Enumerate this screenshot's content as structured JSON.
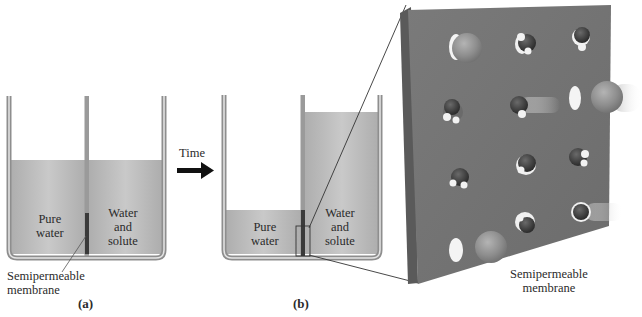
{
  "figure": {
    "panel_a": {
      "label": "(a)",
      "left_compartment": {
        "line1": "Pure",
        "line2": "water"
      },
      "right_compartment": {
        "line1": "Water",
        "line2": "and",
        "line3": "solute"
      },
      "callout": {
        "line1": "Semipermeable",
        "line2": "membrane"
      }
    },
    "transition": {
      "label": "Time"
    },
    "panel_b": {
      "label": "(b)",
      "left_compartment": {
        "line1": "Pure",
        "line2": "water"
      },
      "right_compartment": {
        "line1": "Water",
        "line2": "and",
        "line3": "solute"
      }
    },
    "magnified_view": {
      "callout": {
        "line1": "Semipermeable",
        "line2": "membrane"
      },
      "molecules": {
        "solute_count": 3,
        "water_count": 10
      }
    },
    "colors": {
      "liquid": "#b9b9b9",
      "beaker_wall": "#9a9a9a",
      "membrane_dark": "#3a3a3a",
      "membrane_panel": "#727272",
      "solute_sphere": "#8e8e8e",
      "water_oxygen": "#3c3c3c",
      "water_hydrogen": "#f2f2f2"
    }
  }
}
